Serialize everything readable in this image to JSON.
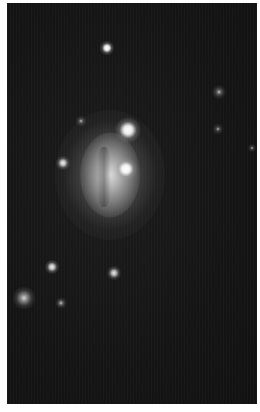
{
  "image": {
    "description": "Grayscale astronomical image of a galaxy with foreground stars on a dark sky background, white border",
    "border_color": "#ffffff",
    "sky_color": "#141414",
    "frame": {
      "x": 7,
      "y": 3,
      "width": 250,
      "height": 401
    }
  },
  "galaxy": {
    "center": [
      110,
      175
    ],
    "halo": {
      "w": 110,
      "h": 130
    },
    "body": {
      "w": 60,
      "h": 85
    },
    "dust_lane": {
      "w": 14,
      "h": 60,
      "offset_x": -6,
      "offset_y": 2
    }
  },
  "stars": [
    {
      "name": "star-top",
      "x": 107,
      "y": 48,
      "r": 5,
      "brightness": 1.0
    },
    {
      "name": "star-upper-bright",
      "x": 128,
      "y": 130,
      "r": 9,
      "brightness": 1.0
    },
    {
      "name": "star-galaxy-overlap",
      "x": 126,
      "y": 169,
      "r": 8,
      "brightness": 1.0
    },
    {
      "name": "star-left-mid",
      "x": 63,
      "y": 163,
      "r": 5,
      "brightness": 0.85
    },
    {
      "name": "star-faint-upper",
      "x": 81,
      "y": 121,
      "r": 4,
      "brightness": 0.35
    },
    {
      "name": "star-right-faint-1",
      "x": 219,
      "y": 92,
      "r": 5,
      "brightness": 0.4
    },
    {
      "name": "star-right-faint-2",
      "x": 218,
      "y": 129,
      "r": 4,
      "brightness": 0.3
    },
    {
      "name": "star-right-edge",
      "x": 252,
      "y": 148,
      "r": 3,
      "brightness": 0.3
    },
    {
      "name": "star-lower-left",
      "x": 52,
      "y": 267,
      "r": 5,
      "brightness": 0.85
    },
    {
      "name": "star-lower-mid",
      "x": 114,
      "y": 273,
      "r": 5,
      "brightness": 0.8
    },
    {
      "name": "star-bottom-left-big",
      "x": 24,
      "y": 298,
      "r": 8,
      "brightness": 0.6
    },
    {
      "name": "star-bottom-faint",
      "x": 61,
      "y": 303,
      "r": 4,
      "brightness": 0.45
    }
  ]
}
